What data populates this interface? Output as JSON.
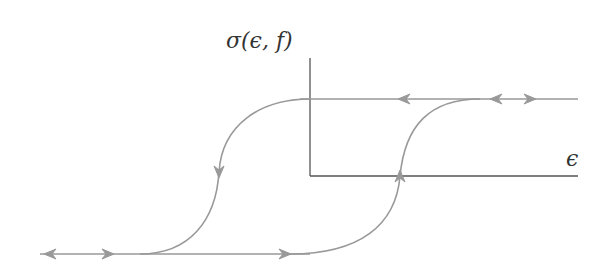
{
  "diagram": {
    "y_axis_label": "σ(ϵ, f)",
    "x_axis_label": "ϵ",
    "colors": {
      "axis": "#555555",
      "curve": "#999999",
      "text": "#333333"
    },
    "axes": {
      "origin": [
        310,
        176
      ],
      "y_top": [
        310,
        58
      ],
      "x_right": [
        578,
        176
      ]
    },
    "branches": [
      {
        "name": "upper-plateau",
        "from": [
          310,
          99
        ],
        "to": [
          578,
          99
        ],
        "arrows": [
          {
            "x": 405,
            "dir": "left"
          },
          {
            "x": 496,
            "dir": "left"
          },
          {
            "x": 530,
            "dir": "right"
          }
        ]
      },
      {
        "name": "lower-plateau",
        "from": [
          40,
          254
        ],
        "to": [
          310,
          254
        ],
        "arrows": [
          {
            "x": 50,
            "dir": "left"
          },
          {
            "x": 108,
            "dir": "right"
          },
          {
            "x": 285,
            "dir": "right"
          }
        ]
      },
      {
        "name": "descending-branch",
        "from": [
          310,
          99
        ],
        "to": [
          140,
          254
        ],
        "arrows": [
          {
            "x": 219,
            "y": 172,
            "dir": "down"
          }
        ]
      },
      {
        "name": "ascending-branch",
        "from": [
          290,
          254
        ],
        "to": [
          480,
          99
        ],
        "arrows": [
          {
            "x": 400,
            "y": 176,
            "dir": "up"
          }
        ]
      }
    ]
  }
}
